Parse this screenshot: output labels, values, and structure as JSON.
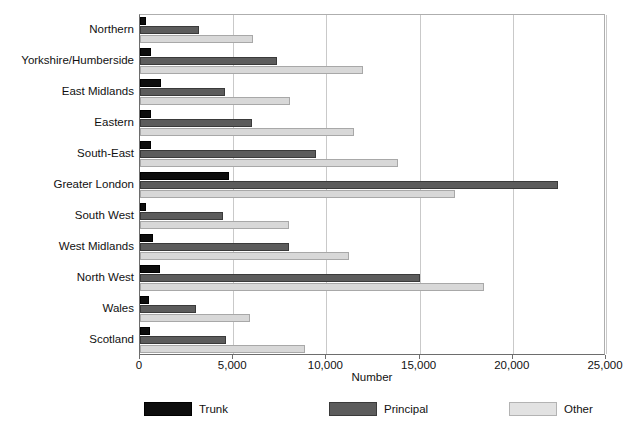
{
  "chart_data": {
    "type": "bar",
    "orientation": "horizontal",
    "title": "",
    "xlabel": "Number",
    "ylabel": "",
    "xlim": [
      0,
      25000
    ],
    "xticks": [
      0,
      5000,
      10000,
      15000,
      20000,
      25000
    ],
    "xtick_labels": [
      "0",
      "5,000",
      "10,000",
      "15,000",
      "20,000",
      "25,000"
    ],
    "grid": "vertical",
    "legend_position": "bottom",
    "categories": [
      "Northern",
      "Yorkshire/Humberside",
      "East Midlands",
      "Eastern",
      "South-East",
      "Greater London",
      "South West",
      "West Midlands",
      "North West",
      "Wales",
      "Scotland"
    ],
    "series": [
      {
        "name": "Trunk",
        "color": "#0d0d0d",
        "values": [
          300,
          600,
          1100,
          600,
          600,
          4750,
          300,
          700,
          1050,
          480,
          550
        ]
      },
      {
        "name": "Principal",
        "color": "#5c5c5c",
        "values": [
          3150,
          7350,
          4550,
          6000,
          9450,
          22400,
          4450,
          8000,
          15000,
          3000,
          4600
        ]
      },
      {
        "name": "Other",
        "color": "#d8d8d8",
        "values": [
          6050,
          11950,
          8050,
          11500,
          13850,
          16900,
          8000,
          11200,
          18450,
          5900,
          8850
        ]
      }
    ]
  },
  "legend": {
    "items": [
      {
        "label": "Trunk",
        "key": "trunk"
      },
      {
        "label": "Principal",
        "key": "principal"
      },
      {
        "label": "Other",
        "key": "other"
      }
    ]
  }
}
